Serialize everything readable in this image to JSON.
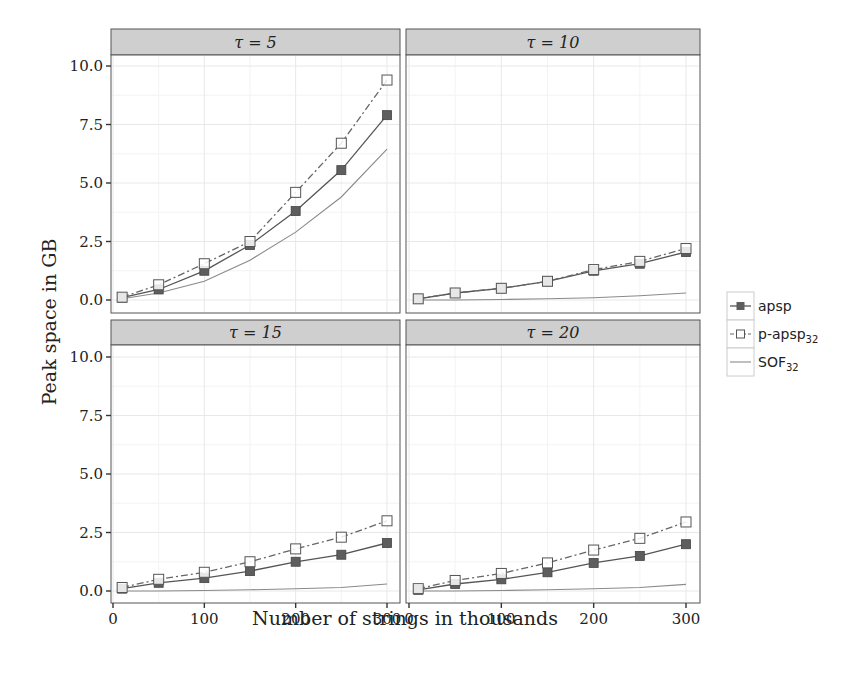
{
  "chart_data": {
    "type": "line",
    "title": "",
    "xlabel": "Number of strings in thousands",
    "ylabel": "Peak space in GB",
    "xlim": [
      0,
      300
    ],
    "ylim": [
      0,
      10
    ],
    "x_ticks": [
      0,
      100,
      200,
      300
    ],
    "x_tick_labels": [
      "0",
      "100",
      "200",
      "300"
    ],
    "y_ticks": [
      0,
      2.5,
      5,
      7.5,
      10
    ],
    "y_tick_labels": [
      "0.0",
      "2.5",
      "5.0",
      "7.5",
      "10.0"
    ],
    "grid": true,
    "legend_position": "right",
    "x": [
      10,
      50,
      100,
      150,
      200,
      250,
      300
    ],
    "legend": [
      {
        "name": "apsp",
        "line": "solid",
        "marker": "filled-square"
      },
      {
        "name": "p-apsp",
        "sub": "32",
        "line": "dashdot",
        "marker": "open-square"
      },
      {
        "name": "SOF",
        "sub": "32",
        "line": "solid-thin",
        "marker": "none"
      }
    ],
    "panels": [
      {
        "label": "τ = 5",
        "series": [
          {
            "name": "apsp",
            "values": [
              0.1,
              0.45,
              1.25,
              2.35,
              3.8,
              5.55,
              7.9
            ]
          },
          {
            "name": "p-apsp32",
            "values": [
              0.12,
              0.65,
              1.55,
              2.5,
              4.6,
              6.7,
              9.4
            ]
          },
          {
            "name": "SOF32",
            "values": [
              0.05,
              0.3,
              0.8,
              1.7,
              2.9,
              4.4,
              6.45
            ]
          }
        ]
      },
      {
        "label": "τ = 10",
        "series": [
          {
            "name": "apsp",
            "values": [
              0.05,
              0.3,
              0.5,
              0.8,
              1.25,
              1.55,
              2.05
            ]
          },
          {
            "name": "p-apsp32",
            "values": [
              0.05,
              0.3,
              0.5,
              0.8,
              1.3,
              1.65,
              2.2
            ]
          },
          {
            "name": "SOF32",
            "values": [
              0.0,
              0.0,
              0.02,
              0.05,
              0.1,
              0.18,
              0.3
            ]
          }
        ]
      },
      {
        "label": "τ = 15",
        "series": [
          {
            "name": "apsp",
            "values": [
              0.1,
              0.35,
              0.55,
              0.85,
              1.25,
              1.55,
              2.05
            ]
          },
          {
            "name": "p-apsp32",
            "values": [
              0.15,
              0.5,
              0.8,
              1.25,
              1.8,
              2.3,
              3.0
            ]
          },
          {
            "name": "SOF32",
            "values": [
              0.0,
              0.0,
              0.02,
              0.05,
              0.1,
              0.15,
              0.3
            ]
          }
        ]
      },
      {
        "label": "τ = 20",
        "series": [
          {
            "name": "apsp",
            "values": [
              0.05,
              0.3,
              0.5,
              0.8,
              1.2,
              1.5,
              2.0
            ]
          },
          {
            "name": "p-apsp32",
            "values": [
              0.1,
              0.45,
              0.75,
              1.2,
              1.75,
              2.25,
              2.95
            ]
          },
          {
            "name": "SOF32",
            "values": [
              0.0,
              0.0,
              0.02,
              0.05,
              0.1,
              0.15,
              0.28
            ]
          }
        ]
      }
    ]
  },
  "colors": {
    "apsp": "#555555",
    "p_apsp": "#666666",
    "sof": "#8a8a8a",
    "strip": "#cfcfcf"
  }
}
